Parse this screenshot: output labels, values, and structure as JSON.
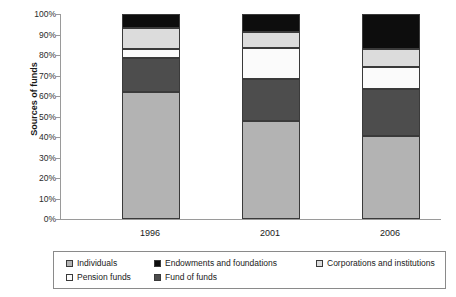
{
  "chart_data": {
    "type": "bar",
    "subtype": "stacked-percent",
    "title": "",
    "xlabel": "",
    "ylabel": "Sources of funds",
    "categories": [
      "1996",
      "2001",
      "2006"
    ],
    "ylim": [
      0,
      100
    ],
    "ytick_labels": [
      "0%",
      "10%",
      "20%",
      "30%",
      "40%",
      "50%",
      "60%",
      "70%",
      "80%",
      "90%",
      "100%"
    ],
    "ytick_values": [
      0,
      10,
      20,
      30,
      40,
      50,
      60,
      70,
      80,
      90,
      100
    ],
    "grid": false,
    "legend_position": "bottom",
    "stack_order_bottom_to_top": [
      "Individuals",
      "Fund of funds",
      "Pension funds",
      "Corporations and institutions",
      "Endowments and foundations"
    ],
    "series": [
      {
        "name": "Individuals",
        "color": "#b3b3b3",
        "values": [
          62,
          48,
          40.5
        ]
      },
      {
        "name": "Fund of funds",
        "color": "#4d4d4d",
        "values": [
          16.5,
          20.5,
          23
        ]
      },
      {
        "name": "Pension funds",
        "color": "#fbfbfb",
        "values": [
          4.5,
          15,
          10.5
        ]
      },
      {
        "name": "Corporations and institutions",
        "color": "#dcdcdc",
        "values": [
          10,
          7.5,
          9
        ]
      },
      {
        "name": "Endowments and foundations",
        "color": "#0d0d0d",
        "values": [
          7,
          9,
          17
        ]
      }
    ],
    "legend_entries": [
      {
        "label": "Individuals",
        "color": "#b3b3b3"
      },
      {
        "label": "Endowments and foundations",
        "color": "#0d0d0d"
      },
      {
        "label": "Corporations and institutions",
        "color": "#dcdcdc"
      },
      {
        "label": "Pension funds",
        "color": "#fbfbfb"
      },
      {
        "label": "Fund of funds",
        "color": "#4d4d4d"
      }
    ]
  }
}
